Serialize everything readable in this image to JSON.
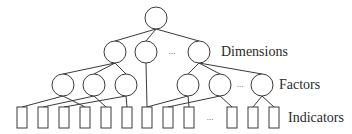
{
  "diagram": {
    "type": "hierarchy-tree",
    "levels": [
      {
        "name": "root",
        "label": ""
      },
      {
        "name": "dimensions",
        "label": "Dimensions"
      },
      {
        "name": "factors",
        "label": "Factors"
      },
      {
        "name": "indicators",
        "label": "Indicators"
      }
    ],
    "ellipsis": "...",
    "colors": {
      "stroke": "#3a3a3a",
      "background": "#ffffff",
      "text": "#2a2a2a"
    },
    "nodes": {
      "root": {
        "shape": "circle",
        "cx": 156,
        "cy": 18,
        "r": 11
      },
      "dimensions": [
        {
          "id": "d1",
          "shape": "circle",
          "cx": 115,
          "cy": 52,
          "r": 11
        },
        {
          "id": "d2",
          "shape": "circle",
          "cx": 146,
          "cy": 52,
          "r": 11
        },
        {
          "id": "d3",
          "shape": "circle",
          "cx": 199,
          "cy": 52,
          "r": 11
        }
      ],
      "factors": [
        {
          "id": "f1",
          "shape": "circle",
          "cx": 63,
          "cy": 85,
          "r": 11
        },
        {
          "id": "f2",
          "shape": "circle",
          "cx": 94,
          "cy": 85,
          "r": 11
        },
        {
          "id": "f3",
          "shape": "circle",
          "cx": 126,
          "cy": 85,
          "r": 11
        },
        {
          "id": "f4",
          "shape": "circle",
          "cx": 188,
          "cy": 85,
          "r": 11
        },
        {
          "id": "f5",
          "shape": "circle",
          "cx": 220,
          "cy": 85,
          "r": 11
        },
        {
          "id": "f6",
          "shape": "circle",
          "cx": 262,
          "cy": 85,
          "r": 11
        }
      ],
      "indicators": [
        {
          "id": "i1",
          "x": 17,
          "y": 107,
          "w": 10,
          "h": 21
        },
        {
          "id": "i2",
          "x": 38,
          "y": 107,
          "w": 10,
          "h": 21
        },
        {
          "id": "i3",
          "x": 59,
          "y": 107,
          "w": 10,
          "h": 21
        },
        {
          "id": "i4",
          "x": 80,
          "y": 107,
          "w": 10,
          "h": 21
        },
        {
          "id": "i5",
          "x": 101,
          "y": 107,
          "w": 10,
          "h": 21
        },
        {
          "id": "i6",
          "x": 122,
          "y": 107,
          "w": 10,
          "h": 21
        },
        {
          "id": "i7",
          "x": 142,
          "y": 107,
          "w": 10,
          "h": 21
        },
        {
          "id": "i8",
          "x": 163,
          "y": 107,
          "w": 10,
          "h": 21
        },
        {
          "id": "i9",
          "x": 184,
          "y": 107,
          "w": 10,
          "h": 21
        },
        {
          "id": "i10",
          "x": 227,
          "y": 107,
          "w": 10,
          "h": 21
        },
        {
          "id": "i11",
          "x": 248,
          "y": 107,
          "w": 10,
          "h": 21
        },
        {
          "id": "i12",
          "x": 269,
          "y": 107,
          "w": 10,
          "h": 21
        }
      ]
    },
    "edges": [
      [
        "root",
        "d1"
      ],
      [
        "root",
        "d2"
      ],
      [
        "root",
        "d3"
      ],
      [
        "d1",
        "f1"
      ],
      [
        "d1",
        "f2"
      ],
      [
        "d1",
        "f3"
      ],
      [
        "d2",
        "i7"
      ],
      [
        "d3",
        "f4"
      ],
      [
        "d3",
        "f5"
      ],
      [
        "d3",
        "f6"
      ],
      [
        "f1",
        "i1"
      ],
      [
        "f1",
        "i4"
      ],
      [
        "f2",
        "i2"
      ],
      [
        "f2",
        "i5"
      ],
      [
        "f3",
        "i3"
      ],
      [
        "f3",
        "i6"
      ],
      [
        "f4",
        "i7"
      ],
      [
        "f4",
        "i9"
      ],
      [
        "f5",
        "i8"
      ],
      [
        "f5",
        "i10"
      ],
      [
        "f6",
        "i11"
      ],
      [
        "f6",
        "i12"
      ]
    ],
    "ellipses_positions": [
      {
        "level": "dimensions",
        "x": 172,
        "y": 54
      },
      {
        "level": "factors",
        "x": 240,
        "y": 87
      },
      {
        "level": "indicators",
        "x": 210,
        "y": 120
      }
    ],
    "label_positions": {
      "dimensions": {
        "x": 221,
        "y": 56
      },
      "factors": {
        "x": 279,
        "y": 89
      },
      "indicators": {
        "x": 288,
        "y": 122
      }
    }
  }
}
